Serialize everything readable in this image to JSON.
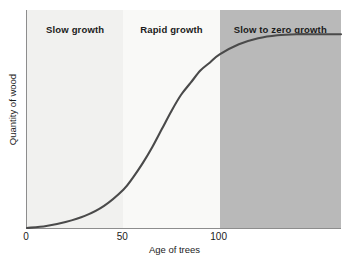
{
  "chart_data": {
    "type": "line",
    "title": "",
    "subtitle": "",
    "xlabel": "Age of trees",
    "ylabel": "Quantity of wood",
    "xlim": [
      0,
      163
    ],
    "ylim": [
      0,
      1.08
    ],
    "grid": false,
    "legend_position": "none",
    "xticks": [
      {
        "value": 0,
        "label": "0"
      },
      {
        "value": 50,
        "label": "50"
      },
      {
        "value": 100,
        "label": "100"
      }
    ],
    "yticks": [],
    "series": [
      {
        "name": "Quantity of wood",
        "color": "#4a4a4a",
        "x": [
          0,
          10,
          20,
          30,
          40,
          50,
          55,
          60,
          65,
          70,
          75,
          80,
          85,
          90,
          95,
          100,
          110,
          120,
          130,
          140,
          150,
          163
        ],
        "values": [
          0.0,
          0.01,
          0.03,
          0.06,
          0.11,
          0.19,
          0.25,
          0.32,
          0.4,
          0.49,
          0.58,
          0.66,
          0.72,
          0.78,
          0.82,
          0.86,
          0.91,
          0.94,
          0.955,
          0.96,
          0.96,
          0.96
        ]
      }
    ],
    "bands": [
      {
        "label": "Slow growth",
        "x_start": 0,
        "x_end": 50,
        "color": "#f1f1ef"
      },
      {
        "label": "Rapid growth",
        "x_start": 50,
        "x_end": 100,
        "color": "#f9f9f7"
      },
      {
        "label": "Slow to zero growth",
        "x_start": 100,
        "x_end": 163,
        "color": "#b9b9b9"
      }
    ],
    "axis_color": "#8d8d8d",
    "background": "#ffffff"
  }
}
